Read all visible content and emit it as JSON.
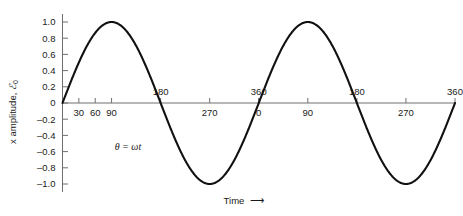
{
  "chart_data": {
    "type": "line",
    "title": "",
    "subtitle": "",
    "xlabel": "Time ⟶",
    "ylabel": "x amplitude, ℰ₀",
    "xlim": [
      0,
      720
    ],
    "ylim": [
      -1.0,
      1.0
    ],
    "grid": false,
    "legend": null,
    "x_unit": "degrees",
    "series": [
      {
        "name": "sine wave",
        "color": "#111111",
        "equation": "y = sin(θ),  θ = ωt",
        "x": [
          0,
          30,
          60,
          90,
          120,
          150,
          180,
          210,
          240,
          270,
          300,
          330,
          360,
          390,
          420,
          450,
          480,
          510,
          540,
          570,
          600,
          630,
          660,
          690,
          720
        ],
        "values": [
          0.0,
          0.5,
          0.866,
          1.0,
          0.866,
          0.5,
          0.0,
          -0.5,
          -0.866,
          -1.0,
          -0.866,
          -0.5,
          0.0,
          0.5,
          0.866,
          1.0,
          0.866,
          0.5,
          0.0,
          -0.5,
          -0.866,
          -1.0,
          -0.866,
          -0.5,
          0.0
        ]
      }
    ],
    "y_ticks": [
      1.0,
      0.8,
      0.6,
      0.4,
      0.2,
      0.0,
      -0.2,
      -0.4,
      -0.6,
      -0.8,
      -1.0
    ],
    "y_tick_labels": [
      "1.0",
      "0.8",
      "0.6",
      "0.4",
      "0.2",
      "0",
      "–0.2",
      "–0.4",
      "–0.6",
      "–0.8",
      "–1.0"
    ],
    "x_ticks_below": [
      {
        "value": 30,
        "label": "30"
      },
      {
        "value": 60,
        "label": "60"
      },
      {
        "value": 90,
        "label": "90"
      },
      {
        "value": 270,
        "label": "270"
      },
      {
        "value": 360,
        "label": "0"
      },
      {
        "value": 450,
        "label": "90"
      },
      {
        "value": 630,
        "label": "270"
      }
    ],
    "x_ticks_above": [
      {
        "value": 180,
        "label": "180"
      },
      {
        "value": 360,
        "label": "360"
      },
      {
        "value": 540,
        "label": "180"
      },
      {
        "value": 720,
        "label": "360"
      }
    ],
    "annotations": [
      {
        "text": "θ = ωt",
        "x": 120,
        "y": -0.58
      }
    ]
  },
  "axes": {
    "y_axis_title": "x amplitude, ℰ₀",
    "y_axis_title_main": "x amplitude, ",
    "y_axis_title_symbol": "ℰ",
    "y_axis_title_subscript": "0",
    "x_axis_title_text": "Time",
    "x_axis_title_arrow": "⟶"
  },
  "annotation": {
    "theta_equation": "θ = ωt"
  },
  "colors": {
    "curve": "#111111",
    "axis": "#6e6e6e",
    "text": "#1a1a1a",
    "background": "#ffffff"
  }
}
